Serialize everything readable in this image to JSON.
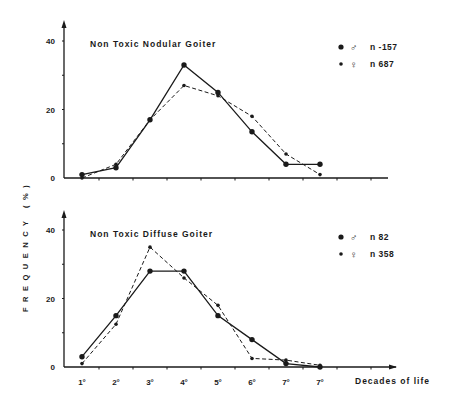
{
  "figure": {
    "y_axis_label": "FREQUENCY (%)",
    "x_axis_label": "Decades of life"
  },
  "chart_data": [
    {
      "type": "line",
      "title": "Non Toxic Nodular Goiter",
      "xlabel": "Decades of life",
      "ylabel": "FREQUENCY (%)",
      "ylim": [
        0,
        40
      ],
      "yticks": [
        "0",
        "20",
        "40"
      ],
      "categories": [
        "1°",
        "2°",
        "3°",
        "4°",
        "5°",
        "6°",
        "7°",
        "7°"
      ],
      "x_tick_labels_visible": false,
      "grid": false,
      "legend_position": "top-right",
      "series": [
        {
          "name": "♂ n -157",
          "symbol": "♂",
          "n_label": "n -157",
          "marker": "large-dot",
          "line": "solid",
          "values": [
            1,
            3,
            17,
            33,
            25,
            13.5,
            4,
            4
          ]
        },
        {
          "name": "♀ n 687",
          "symbol": "♀",
          "n_label": "n 687",
          "marker": "small-dot",
          "line": "dashed",
          "values": [
            0,
            4,
            17,
            27,
            24,
            18,
            7,
            1
          ]
        }
      ]
    },
    {
      "type": "line",
      "title": "Non Toxic Diffuse Goiter",
      "xlabel": "Decades of life",
      "ylabel": "FREQUENCY (%)",
      "ylim": [
        0,
        40
      ],
      "yticks": [
        "0",
        "20",
        "40"
      ],
      "categories": [
        "1°",
        "2°",
        "3°",
        "4°",
        "5°",
        "6°",
        "7°",
        "7°"
      ],
      "x_tick_labels_visible": true,
      "grid": false,
      "legend_position": "top-right",
      "series": [
        {
          "name": "♂ n 82",
          "symbol": "♂",
          "n_label": "n 82",
          "marker": "large-dot",
          "line": "solid",
          "values": [
            3,
            15,
            28,
            28,
            15,
            8,
            1,
            0
          ]
        },
        {
          "name": "♀ n 358",
          "symbol": "♀",
          "n_label": "n 358",
          "marker": "small-dot",
          "line": "dashed",
          "values": [
            1,
            12.5,
            35,
            26,
            18,
            2.5,
            2,
            0.5
          ]
        }
      ]
    }
  ],
  "colors": {
    "ink": "#1a1a1a",
    "background": "#ffffff"
  }
}
